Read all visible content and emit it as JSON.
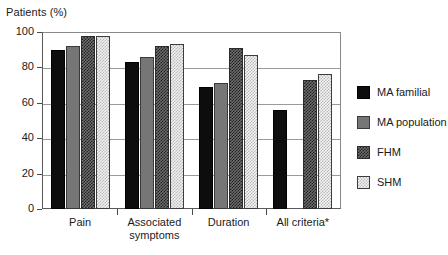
{
  "chart_data": {
    "type": "bar",
    "title": "Patients (%)",
    "xlabel": "",
    "ylabel": "Patients (%)",
    "ylim": [
      0,
      100
    ],
    "yticks": [
      0,
      20,
      40,
      60,
      80,
      100
    ],
    "grid": true,
    "legend_position": "right",
    "categories": [
      "Pain",
      "Associated\nsymptoms",
      "Duration",
      "All criteria*"
    ],
    "series": [
      {
        "name": "MA familial",
        "values": [
          90,
          83,
          69,
          56
        ]
      },
      {
        "name": "MA population",
        "values": [
          92,
          86,
          71,
          null
        ]
      },
      {
        "name": "FHM",
        "values": [
          98,
          92,
          91,
          73
        ]
      },
      {
        "name": "SHM",
        "values": [
          98,
          93,
          87,
          76
        ]
      }
    ],
    "note": "All criteria*"
  },
  "legend": {
    "items": [
      {
        "label": "MA familial",
        "swatch": "black-solid-swatch"
      },
      {
        "label": "MA population",
        "swatch": "gray-solid-swatch"
      },
      {
        "label": "FHM",
        "swatch": "dark-checkered-swatch"
      },
      {
        "label": "SHM",
        "swatch": "light-dotted-swatch"
      }
    ]
  }
}
